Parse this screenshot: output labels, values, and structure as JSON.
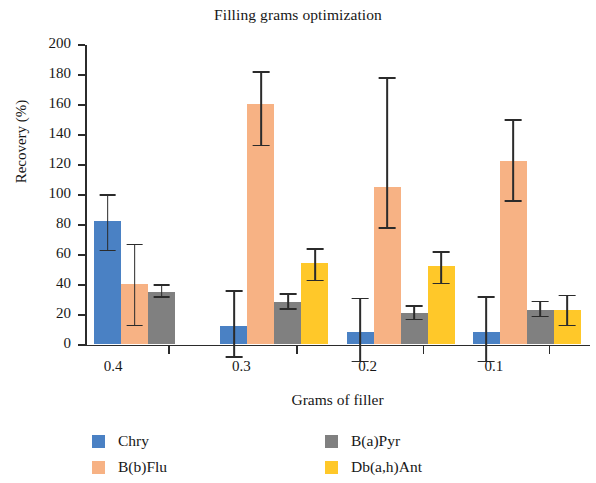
{
  "chart_data": {
    "type": "bar",
    "title": "Filling grams optimization",
    "xlabel": "Grams of filler",
    "ylabel": "Recovery (%)",
    "categories": [
      "0.4",
      "0.3",
      "0.2",
      "0.1"
    ],
    "ylim": [
      0,
      200
    ],
    "yticks": [
      0,
      20,
      40,
      60,
      80,
      100,
      120,
      140,
      160,
      180,
      200
    ],
    "grid": false,
    "legend_position": "bottom",
    "error_bars": "asymmetric-std",
    "series": [
      {
        "name": "Chry",
        "color": "#4a81c4",
        "values": [
          82,
          12,
          8,
          8
        ],
        "err_low": [
          63,
          -8,
          -11,
          -11
        ],
        "err_high": [
          100,
          36,
          31,
          32
        ]
      },
      {
        "name": "B(b)Flu",
        "color": "#f7b284",
        "values": [
          40,
          160,
          105,
          122
        ],
        "err_low": [
          13,
          133,
          78,
          96
        ],
        "err_high": [
          67,
          182,
          178,
          150
        ]
      },
      {
        "name": "B(a)Pyr",
        "color": "#808080",
        "values": [
          35,
          28,
          21,
          23
        ],
        "err_low": [
          32,
          24,
          17,
          19
        ],
        "err_high": [
          40,
          34,
          26,
          29
        ]
      },
      {
        "name": "Db(a,h)Ant",
        "color": "#ffc829",
        "values": [
          null,
          54,
          52,
          23
        ],
        "err_low": [
          null,
          43,
          41,
          13
        ],
        "err_high": [
          null,
          64,
          62,
          33
        ]
      }
    ]
  }
}
